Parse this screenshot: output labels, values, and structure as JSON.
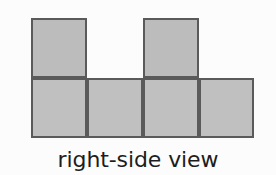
{
  "figure": {
    "caption": "right-side view",
    "colors": {
      "background": "#fcfcfc",
      "cell_fill": "#bdbdbd",
      "cell_border": "#5a5a5a",
      "caption_text": "#1d1d1d"
    },
    "grid": {
      "columns": 4,
      "rows": 2,
      "cell_width": 56,
      "cell_height": 60,
      "origin_x": 31,
      "origin_y": 18
    },
    "cells": [
      {
        "name": "cell-top-col1",
        "row": 0,
        "col": 0,
        "filled": true,
        "left": 31,
        "top": 18,
        "width": 56,
        "height": 60,
        "tone": "tone-a"
      },
      {
        "name": "cell-top-col2",
        "row": 0,
        "col": 1,
        "filled": false,
        "left": 87,
        "top": 18,
        "width": 56,
        "height": 60,
        "tone": "tone-a"
      },
      {
        "name": "cell-top-col3",
        "row": 0,
        "col": 2,
        "filled": true,
        "left": 143,
        "top": 18,
        "width": 56,
        "height": 60,
        "tone": "tone-a"
      },
      {
        "name": "cell-top-col4",
        "row": 0,
        "col": 3,
        "filled": false,
        "left": 199,
        "top": 18,
        "width": 56,
        "height": 60,
        "tone": "tone-a"
      },
      {
        "name": "cell-bottom-col1",
        "row": 1,
        "col": 0,
        "filled": true,
        "left": 31,
        "top": 78,
        "width": 56,
        "height": 60,
        "tone": "tone-b"
      },
      {
        "name": "cell-bottom-col2",
        "row": 1,
        "col": 1,
        "filled": true,
        "left": 87,
        "top": 78,
        "width": 56,
        "height": 60,
        "tone": "tone-b"
      },
      {
        "name": "cell-bottom-col3",
        "row": 1,
        "col": 2,
        "filled": true,
        "left": 143,
        "top": 78,
        "width": 56,
        "height": 60,
        "tone": "tone-b"
      },
      {
        "name": "cell-bottom-col4",
        "row": 1,
        "col": 3,
        "filled": true,
        "left": 199,
        "top": 78,
        "width": 55,
        "height": 60,
        "tone": "tone-b"
      }
    ]
  }
}
